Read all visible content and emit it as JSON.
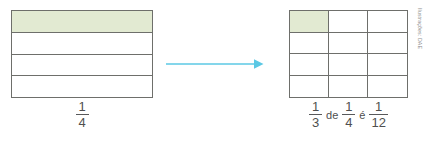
{
  "figure": {
    "type": "fraction-of-a-fraction-model",
    "colors": {
      "shade_fill": "#e2ead2",
      "stroke": "#6e6f6b",
      "arrow": "#5bc8e4",
      "text": "#4f4f4f",
      "credit_text": "#8d8d8d"
    },
    "left": {
      "name": "bar-model-fourths",
      "rows": 4,
      "columns": 1,
      "shaded_cells": 1,
      "total_cells": 4,
      "caption": {
        "numerator": "1",
        "denominator": "4"
      }
    },
    "arrow": {
      "name": "transformation-arrow",
      "direction": "right",
      "color": "#5bc8e4"
    },
    "right": {
      "name": "area-model-twelfths",
      "rows": 4,
      "columns": 3,
      "shaded_cells": 1,
      "total_cells": 12,
      "caption": {
        "first": {
          "numerator": "1",
          "denominator": "3"
        },
        "word_of": "de",
        "second": {
          "numerator": "1",
          "denominator": "4"
        },
        "word_is": "é",
        "result": {
          "numerator": "1",
          "denominator": "12"
        }
      }
    },
    "credit": "Ilustrações: DAE"
  }
}
